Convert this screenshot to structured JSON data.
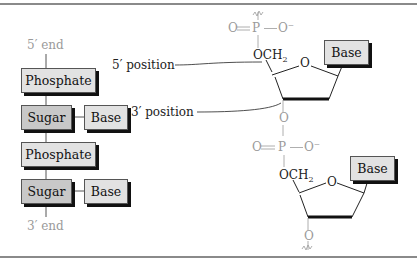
{
  "schematic": {
    "top_label": "5′ end",
    "bottom_label": "3′ end",
    "units": [
      {
        "phosphate": "Phosphate",
        "sugar": "Sugar",
        "base": "Base"
      },
      {
        "phosphate": "Phosphate",
        "sugar": "Sugar",
        "base": "Base"
      }
    ]
  },
  "structure": {
    "five_prime_label": "5′ position",
    "three_prime_label": "3′ position",
    "phosphate_top": {
      "left": "O",
      "center": "P",
      "right": "O⁻"
    },
    "phosphate_mid": {
      "left": "O",
      "center": "P",
      "right": "O⁻"
    },
    "och2": "OCH",
    "och2_sub": "2",
    "ring_oxygen": "O",
    "link_oxygen": "O",
    "base_top": "Base",
    "base_bottom": "Base"
  },
  "colors": {
    "phosphate_box": "#e2e2e2",
    "sugar_box": "#c8c8c8",
    "base_box": "#e2e2e2",
    "grey_text": "#9a9a9a",
    "rule": "#8a8a8a"
  }
}
